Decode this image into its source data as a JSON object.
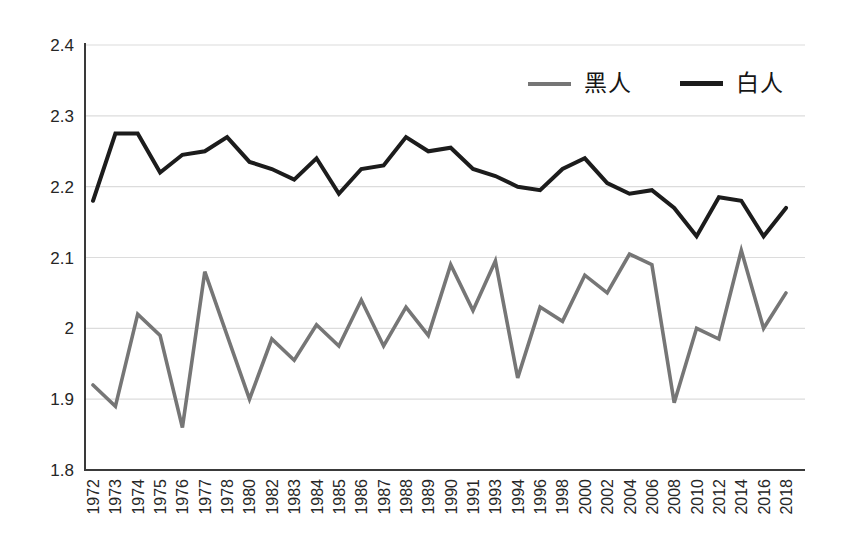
{
  "chart_data": {
    "type": "line",
    "title": "",
    "xlabel": "",
    "ylabel": "",
    "x": [
      "1972",
      "1973",
      "1974",
      "1975",
      "1976",
      "1977",
      "1978",
      "1980",
      "1982",
      "1983",
      "1984",
      "1985",
      "1986",
      "1987",
      "1988",
      "1989",
      "1990",
      "1991",
      "1993",
      "1994",
      "1996",
      "1998",
      "2000",
      "2002",
      "2004",
      "2006",
      "2008",
      "2010",
      "2012",
      "2014",
      "2016",
      "2018"
    ],
    "series": [
      {
        "name": "黑人",
        "color": "#767676",
        "values": [
          1.92,
          1.89,
          2.02,
          1.99,
          1.86,
          2.08,
          1.99,
          1.9,
          1.985,
          1.955,
          2.005,
          1.975,
          2.04,
          1.975,
          2.03,
          1.99,
          2.09,
          2.025,
          2.095,
          1.93,
          2.03,
          2.01,
          2.075,
          2.05,
          2.105,
          2.09,
          1.895,
          2.0,
          1.985,
          2.11,
          2.0,
          2.05
        ]
      },
      {
        "name": "白人",
        "color": "#1c1c1c",
        "values": [
          2.18,
          2.275,
          2.275,
          2.22,
          2.245,
          2.25,
          2.27,
          2.235,
          2.225,
          2.21,
          2.24,
          2.19,
          2.225,
          2.23,
          2.27,
          2.25,
          2.255,
          2.225,
          2.215,
          2.2,
          2.195,
          2.225,
          2.24,
          2.205,
          2.19,
          2.195,
          2.17,
          2.13,
          2.185,
          2.18,
          2.13,
          2.17
        ]
      }
    ],
    "ylim": [
      1.8,
      2.4
    ],
    "ytick_step": 0.1,
    "ytick_labels": [
      "1.8",
      "1.9",
      "2",
      "2.1",
      "2.2",
      "2.3",
      "2.4"
    ],
    "grid": "horizontal",
    "legend_position": "top-inside",
    "colors": {
      "gridline": "#dcdcdc",
      "axis": "#3a3a3a",
      "tick_text": "#262626"
    }
  }
}
